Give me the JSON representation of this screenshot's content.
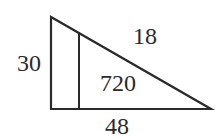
{
  "figure": {
    "type": "right-triangle-diagram",
    "stroke_color": "#2a2a2a",
    "labels": {
      "left_side": "30",
      "top_region": "18",
      "area": "720",
      "bottom_side": "48"
    }
  }
}
